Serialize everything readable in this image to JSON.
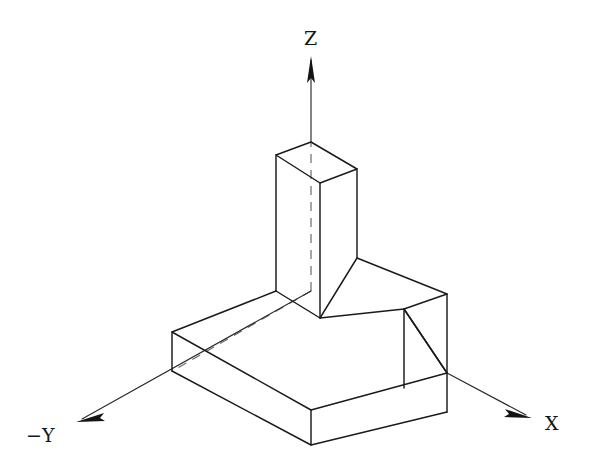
{
  "figure": {
    "type": "isometric-technical-drawing",
    "background_color": "#ffffff",
    "line_color": "#1a1a1a",
    "hidden_line_color": "#6b6b6b",
    "axis_color": "#2a2a2a"
  },
  "axes": [
    {
      "id": "z",
      "label": "Z",
      "label_x": 304,
      "label_y": 45,
      "line": {
        "x1": 311,
        "y1": 291,
        "x2": 311,
        "y2": 58
      },
      "visible_from": 142,
      "arrow_tip_x": 311,
      "arrow_tip_y": 56
    },
    {
      "id": "x",
      "label": "X",
      "label_x": 545,
      "label_y": 430,
      "line": {
        "x1": 447,
        "y1": 373,
        "x2": 530,
        "y2": 417
      },
      "arrow_tip_x": 532,
      "arrow_tip_y": 418
    },
    {
      "id": "-y",
      "label": "−Y",
      "label_x": 26,
      "label_y": 442,
      "line": {
        "x1": 311,
        "y1": 291,
        "x2": 78,
        "y2": 421
      },
      "arrow_tip_x": 76,
      "arrow_tip_y": 422
    }
  ],
  "vertices": {
    "top_back": {
      "x": 311,
      "y": 142
    },
    "top_left": {
      "x": 276,
      "y": 155
    },
    "top_right": {
      "x": 357,
      "y": 169
    },
    "top_front": {
      "x": 320,
      "y": 183
    },
    "upright_left_b": {
      "x": 276,
      "y": 291
    },
    "upright_front_b": {
      "x": 320,
      "y": 318
    },
    "upright_right_b": {
      "x": 357,
      "y": 258
    },
    "step_back_r": {
      "x": 447,
      "y": 294
    },
    "step_front_r": {
      "x": 404,
      "y": 309
    },
    "step_front_in": {
      "x": 320,
      "y": 318
    },
    "step_bot_r": {
      "x": 447,
      "y": 373
    },
    "step_bot_f": {
      "x": 404,
      "y": 388
    },
    "base_back": {
      "x": 311,
      "y": 291
    },
    "base_left_t": {
      "x": 172,
      "y": 332
    },
    "base_left_b": {
      "x": 172,
      "y": 371
    },
    "base_front_t": {
      "x": 311,
      "y": 410
    },
    "base_front_b": {
      "x": 311,
      "y": 445
    },
    "base_right_t": {
      "x": 447,
      "y": 373
    },
    "base_right_b": {
      "x": 447,
      "y": 412
    }
  },
  "hidden_edges": [
    {
      "name": "base-back-left-hidden",
      "x1": 311,
      "y1": 291,
      "x2": 176,
      "y2": 369
    },
    {
      "name": "z-axis-inside-object",
      "x1": 311,
      "y1": 291,
      "x2": 311,
      "y2": 142
    }
  ]
}
